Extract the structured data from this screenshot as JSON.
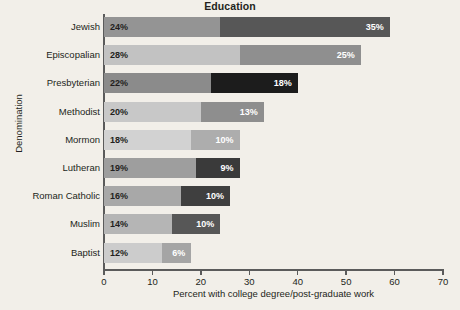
{
  "chart_data": {
    "type": "bar",
    "orientation": "horizontal",
    "stacked": true,
    "title": "Education",
    "xlabel": "Percent with college degree/post-graduate work",
    "ylabel": "Denomination",
    "xlim": [
      0,
      70
    ],
    "xticks": [
      0,
      10,
      20,
      30,
      40,
      50,
      60,
      70
    ],
    "xtick_labels": [
      "0",
      "10",
      "20",
      "30",
      "40",
      "50",
      "60",
      "70"
    ],
    "grid": false,
    "legend": "none",
    "categories": [
      "Jewish",
      "Episcopalian",
      "Presbyterian",
      "Methodist",
      "Mormon",
      "Lutheran",
      "Roman Catholic",
      "Muslim",
      "Baptist"
    ],
    "series": [
      {
        "name": "College degree",
        "values": [
          24,
          28,
          22,
          20,
          18,
          19,
          16,
          14,
          12
        ],
        "labels": [
          "24%",
          "28%",
          "22%",
          "20%",
          "18%",
          "19%",
          "16%",
          "14%",
          "12%"
        ]
      },
      {
        "name": "Post-graduate work",
        "values": [
          35,
          25,
          18,
          13,
          10,
          9,
          10,
          10,
          6
        ],
        "labels": [
          "35%",
          "25%",
          "18%",
          "13%",
          "10%",
          "9%",
          "10%",
          "10%",
          "6%"
        ]
      }
    ],
    "totals": [
      59,
      53,
      40,
      33,
      28,
      28,
      26,
      24,
      18
    ],
    "rows": [
      {
        "category": "Jewish",
        "seg1_value": 24,
        "seg1_label": "24%",
        "seg1_color": "#949494",
        "seg2_value": 35,
        "seg2_label": "35%",
        "seg2_color": "#575757"
      },
      {
        "category": "Episcopalian",
        "seg1_value": 28,
        "seg1_label": "28%",
        "seg1_color": "#c2c2c2",
        "seg2_value": 25,
        "seg2_label": "25%",
        "seg2_color": "#8f8f8f"
      },
      {
        "category": "Presbyterian",
        "seg1_value": 22,
        "seg1_label": "22%",
        "seg1_color": "#8b8b8b",
        "seg2_value": 18,
        "seg2_label": "18%",
        "seg2_color": "#1c1c1c"
      },
      {
        "category": "Methodist",
        "seg1_value": 20,
        "seg1_label": "20%",
        "seg1_color": "#c8c8c8",
        "seg2_value": 13,
        "seg2_label": "13%",
        "seg2_color": "#8e8e8e"
      },
      {
        "category": "Mormon",
        "seg1_value": 18,
        "seg1_label": "18%",
        "seg1_color": "#d2d2d2",
        "seg2_value": 10,
        "seg2_label": "10%",
        "seg2_color": "#adadad"
      },
      {
        "category": "Lutheran",
        "seg1_value": 19,
        "seg1_label": "19%",
        "seg1_color": "#9e9e9e",
        "seg2_value": 9,
        "seg2_label": "9%",
        "seg2_color": "#3a3a3a"
      },
      {
        "category": "Roman Catholic",
        "seg1_value": 16,
        "seg1_label": "16%",
        "seg1_color": "#a8a8a8",
        "seg2_value": 10,
        "seg2_label": "10%",
        "seg2_color": "#3f3f3f"
      },
      {
        "category": "Muslim",
        "seg1_value": 14,
        "seg1_label": "14%",
        "seg1_color": "#b5b5b5",
        "seg2_value": 10,
        "seg2_label": "10%",
        "seg2_color": "#575757"
      },
      {
        "category": "Baptist",
        "seg1_value": 12,
        "seg1_label": "12%",
        "seg1_color": "#cccccc",
        "seg2_value": 6,
        "seg2_label": "6%",
        "seg2_color": "#a5a5a5"
      }
    ]
  },
  "colors": {
    "background": "#f2efe9",
    "axis": "#5b5b5b",
    "text": "#231f20",
    "label_on_dark": "#ffffff"
  }
}
